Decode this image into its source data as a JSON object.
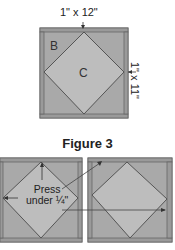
{
  "top_figure": {
    "dimension_top": "1\" x 12\"",
    "dimension_side": "1\" x 11\"",
    "piece_labels": [
      "B",
      "C"
    ]
  },
  "caption": "Figure 3",
  "bottom_figure": {
    "press_line1": "Press",
    "press_line2": "under ¼\""
  },
  "colors": {
    "border_strip": "#9a9a9a",
    "triangle_b": "#a9a9a9",
    "center_c": "#bdbdbd",
    "outline": "#555555"
  }
}
